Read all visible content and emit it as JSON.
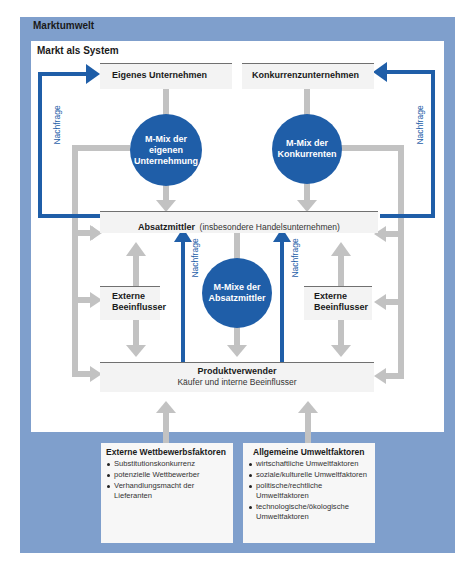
{
  "outer_title": "Marktumwelt",
  "inner_title": "Markt als System",
  "boxes": {
    "own_company": "Eigenes Unternehmen",
    "competitors": "Konkurrenzunternehmen",
    "intermediaries": "Absatzmittler",
    "intermediaries_note": "(insbesondere Handelsunternehmen)",
    "external_left_1": "Externe",
    "external_left_2": "Beeinflusser",
    "external_right_1": "Externe",
    "external_right_2": "Beeinflusser",
    "users": "Produktverwender",
    "users_sub": "Käufer und interne Beeinflusser"
  },
  "circles": {
    "own_mix": [
      "M-Mix der",
      "eigenen",
      "Unternehmung"
    ],
    "comp_mix": [
      "M-Mix der",
      "Konkurrenten"
    ],
    "intermediary_mix": [
      "M-Mixe der",
      "Absatzmittler"
    ]
  },
  "demand_label": "Nachfrage",
  "factors": {
    "competition": {
      "title": "Externe Wettbewerbsfaktoren",
      "items": [
        "Substitutionskonkurrenz",
        "potenzielle Wettbewerber",
        "Verhandlungsmacht der Lieferanten"
      ]
    },
    "environment": {
      "title": "Allgemeine Umweltfaktoren",
      "items": [
        "wirtschaftliche Umweltfaktoren",
        "soziale/kulturelle Umweltfaktoren",
        "politische/rechtliche Umweltfaktoren",
        "technologische/ökologische Umweltfaktoren"
      ]
    }
  },
  "colors": {
    "frame": "#7f9fcc",
    "accent_blue": "#1f5ea8",
    "arrow_gray": "#c2c2c2",
    "box_fill": "#f3f3f3"
  }
}
